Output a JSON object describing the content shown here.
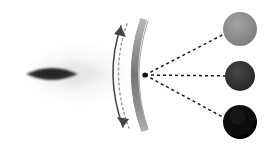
{
  "canvas": {
    "width": 266,
    "height": 149,
    "background": "#ffffff",
    "title": "Curved scanning mirror directing rays to three detector spots"
  },
  "palette": {
    "background": "#ffffff",
    "eye_core_dark": "#2b2b2b",
    "eye_core_mid": "#3a3a3a",
    "eye_halo_pale": "#ededed",
    "eye_halo_faint": "#f4f4f4",
    "arc_band_light": "#b4b4b4",
    "arc_band_mid": "#8a8a8a",
    "arc_band_dark": "#6f6f6f",
    "arc_highlight": "#ffffff",
    "dotted_reference": "#9a9a9a",
    "motion_arrow": "#444444",
    "ray_dash": "#1a1a1a",
    "spot_top": "#8c8c8c",
    "spot_middle": "#333333",
    "spot_bottom": "#0a0a0a"
  },
  "eye": {
    "label": "eye-lens-source",
    "core_cx": 52,
    "core_cy": 74,
    "core_rx": 26,
    "core_ry": 12,
    "halo_cx": 78,
    "halo_cy": 74,
    "halo_rx": 52,
    "halo_ry": 30
  },
  "mirror": {
    "label": "curved-scanning-mirror",
    "band_thickness": 7,
    "top_x": 143,
    "top_y": 18,
    "bottom_x": 143,
    "bottom_y": 132,
    "bulge_x": 122,
    "highlight_offset": 5
  },
  "reference_curve": {
    "label": "dotted-reference-position",
    "dash_pattern": "2,3"
  },
  "motion_arrow": {
    "label": "double-headed-motion-arrow",
    "top_x": 120,
    "top_y": 20,
    "bottom_x": 122,
    "bottom_y": 133
  },
  "focal_point": {
    "label": "focal-convergence-point",
    "x": 145,
    "y": 75
  },
  "rays": [
    {
      "name": "ray-upper",
      "to_x": 232,
      "to_y": 30,
      "dash": "3,3"
    },
    {
      "name": "ray-middle",
      "to_x": 232,
      "to_y": 76,
      "dash": "3,3"
    },
    {
      "name": "ray-lower",
      "to_x": 232,
      "to_y": 122,
      "dash": "3,3"
    }
  ],
  "spots": [
    {
      "name": "spot-top",
      "cx": 240,
      "cy": 29,
      "r": 17,
      "fill": "#8c8c8c",
      "shade": "light-gray"
    },
    {
      "name": "spot-middle",
      "cx": 240,
      "cy": 76,
      "r": 15,
      "fill": "#333333",
      "shade": "dark-gray"
    },
    {
      "name": "spot-bottom",
      "cx": 240,
      "cy": 122,
      "r": 17,
      "fill": "#0a0a0a",
      "shade": "near-black"
    }
  ]
}
